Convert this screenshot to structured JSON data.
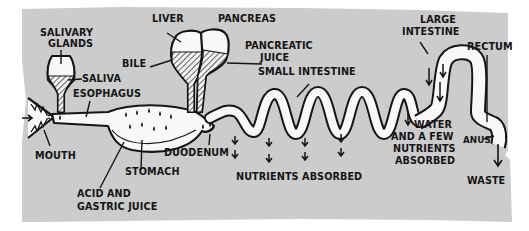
{
  "diagram": {
    "colors": {
      "background": "#ffffff",
      "panel": "#cccccc",
      "tract_fill": "#f8f8f8",
      "ink": "#151515"
    },
    "labels": {
      "salivary_glands_1": "SALIVARY",
      "salivary_glands_2": "GLANDS",
      "saliva": "SALIVA",
      "esophagus": "ESOPHAGUS",
      "mouth": "MOUTH",
      "liver": "LIVER",
      "pancreas": "PANCREAS",
      "bile": "BILE",
      "pancreatic_juice_1": "PANCREATIC",
      "pancreatic_juice_2": "JUICE",
      "small_intestine": "SMALL INTESTINE",
      "stomach": "STOMACH",
      "duodenum": "DUODENUM",
      "acid_1": "ACID AND",
      "acid_2": "GASTRIC JUICE",
      "nutrients_absorbed": "NUTRIENTS ABSORBED",
      "large_intestine_1": "LARGE",
      "large_intestine_2": "INTESTINE",
      "rectum": "RECTUM",
      "water_1": "WATER",
      "water_2": "AND A FEW",
      "water_3": "NUTRIENTS",
      "water_4": "ABSORBED",
      "anus": "ANUS",
      "waste": "WASTE"
    },
    "icons": [
      "food-in-arrow-icon",
      "absorption-arrow-icon",
      "waste-arrow-icon",
      "droplet-icon",
      "teeth-icon"
    ]
  }
}
